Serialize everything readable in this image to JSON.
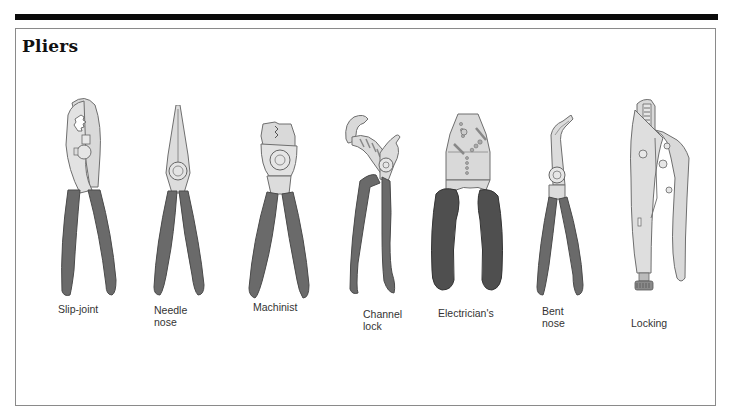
{
  "page": {
    "title": "Pliers"
  },
  "colors": {
    "metal": "#d9d9d9",
    "metal_outline": "#6e6e6e",
    "grip": "#6a6a6a",
    "grip_dark": "#4a4a4a",
    "rule": "#0a0a0a"
  },
  "tools": [
    {
      "id": "slip-joint",
      "label": "Slip-joint"
    },
    {
      "id": "needle-nose",
      "label": "Needle\nnose"
    },
    {
      "id": "machinist",
      "label": "Machinist"
    },
    {
      "id": "channel-lock",
      "label": "Channel\nlock"
    },
    {
      "id": "electricians",
      "label": "Electrician's"
    },
    {
      "id": "bent-nose",
      "label": "Bent\nnose"
    },
    {
      "id": "locking",
      "label": "Locking"
    }
  ]
}
